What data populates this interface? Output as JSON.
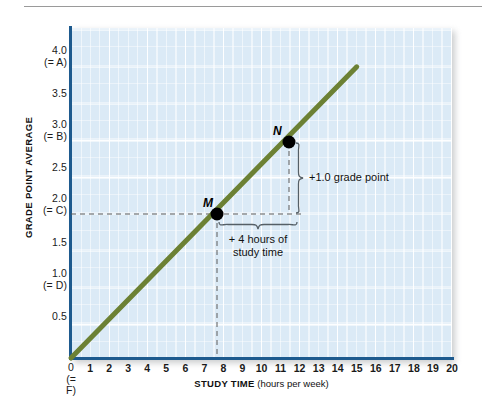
{
  "figure": {
    "y_axis_title": "GRADE POINT AVERAGE",
    "x_axis_title_strong": "STUDY TIME",
    "x_axis_title_paren": " (hours per week)",
    "line_color": "#6c8134",
    "axis_color": "#1d5a8e",
    "panel_color": "#dbeaf6",
    "grid_color": "#ffffff",
    "marker_color": "#000000"
  },
  "y_ticks": [
    {
      "value": "4.0",
      "sub": "(= A)"
    },
    {
      "value": "3.5",
      "sub": ""
    },
    {
      "value": "3.0",
      "sub": "(= B)"
    },
    {
      "value": "2.5",
      "sub": ""
    },
    {
      "value": "2.0",
      "sub": "(= C)"
    },
    {
      "value": "1.5",
      "sub": ""
    },
    {
      "value": "1.0",
      "sub": "(= D)"
    },
    {
      "value": "0.5",
      "sub": ""
    },
    {
      "value": "0",
      "sub": "(= F)"
    }
  ],
  "x_ticks": [
    "1",
    "2",
    "3",
    "4",
    "5",
    "6",
    "7",
    "8",
    "9",
    "10",
    "11",
    "12",
    "13",
    "14",
    "15",
    "16",
    "17",
    "18",
    "19",
    "20"
  ],
  "x_zero": {
    "value": "0",
    "sub": "(= F)"
  },
  "points": [
    {
      "id": "M",
      "label": "M",
      "x": 8,
      "y": 2.0
    },
    {
      "id": "N",
      "label": "N",
      "x": 12,
      "y": 3.0
    }
  ],
  "annotations": {
    "grade_point": "+1.0 grade point",
    "study_time_line1": "+ 4 hours of",
    "study_time_line2": "study time"
  },
  "chart_data": {
    "type": "line",
    "title": "",
    "xlabel": "STUDY TIME (hours per week)",
    "ylabel": "GRADE POINT AVERAGE",
    "xlim": [
      0,
      20
    ],
    "ylim": [
      0,
      4.25
    ],
    "xticks": [
      0,
      1,
      2,
      3,
      4,
      5,
      6,
      7,
      8,
      9,
      10,
      11,
      12,
      13,
      14,
      15,
      16,
      17,
      18,
      19,
      20
    ],
    "yticks": [
      0,
      0.5,
      1.0,
      1.5,
      2.0,
      2.5,
      3.0,
      3.5,
      4.0
    ],
    "ytick_grades": {
      "0": "F",
      "1.0": "D",
      "2.0": "C",
      "3.0": "B",
      "4.0": "A"
    },
    "grid": true,
    "legend": "none",
    "series": [
      {
        "name": "GPA vs study time",
        "color": "#6c8134",
        "x": [
          0,
          15
        ],
        "y": [
          0,
          3.75
        ],
        "slope": 0.25,
        "intercept": 0
      }
    ],
    "markers": [
      {
        "label": "M",
        "x": 8,
        "y": 2.0
      },
      {
        "label": "N",
        "x": 12,
        "y": 3.0
      }
    ],
    "annotations": [
      {
        "text": "+1.0 grade point",
        "from": [
          12,
          2.0
        ],
        "to": [
          12,
          3.0
        ],
        "orientation": "vertical"
      },
      {
        "text": "+ 4 hours of study time",
        "from": [
          8,
          2.0
        ],
        "to": [
          12,
          2.0
        ],
        "orientation": "horizontal"
      }
    ]
  }
}
